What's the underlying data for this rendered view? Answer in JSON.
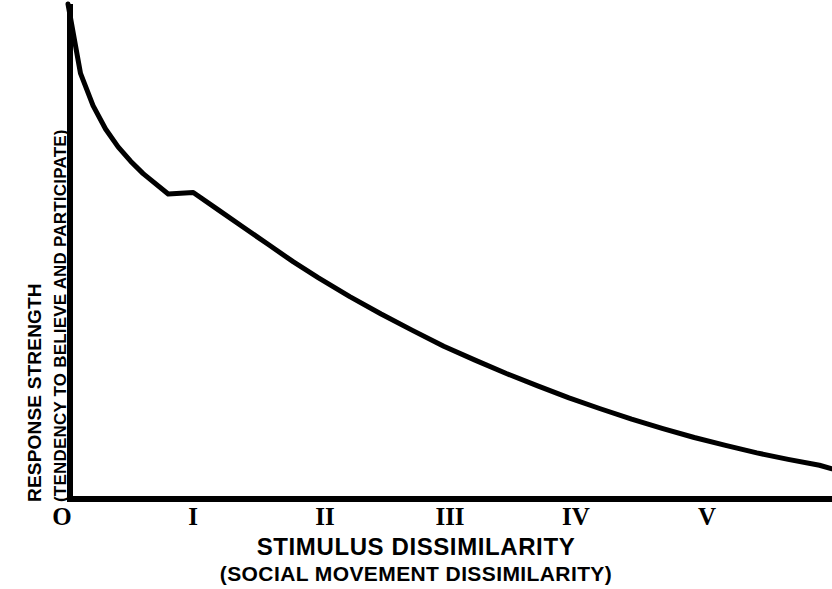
{
  "chart_data": {
    "type": "line",
    "title": "",
    "xlabel": "STIMULUS DISSIMILARITY",
    "xlabel_sub": "(SOCIAL MOVEMENT DISSIMILARITY)",
    "ylabel": "RESPONSE STRENGTH",
    "ylabel_sub": "(TENDENCY TO BELIEVE AND PARTICIPATE)",
    "grid": false,
    "legend": false,
    "xtick_labels": [
      "O",
      "I",
      "II",
      "III",
      "IV",
      "V"
    ],
    "ytick_labels": [],
    "xlim": [
      0,
      6.1
    ],
    "ylim": [
      0,
      1
    ],
    "axis_color": "#000000",
    "curve_color": "#000000",
    "background_color": "#ffffff",
    "series": [
      {
        "name": "response strength",
        "x": [
          0.0,
          0.1,
          0.2,
          0.3,
          0.4,
          0.5,
          0.6,
          0.8,
          1.0,
          1.2,
          1.4,
          1.6,
          1.8,
          2.0,
          2.25,
          2.5,
          2.75,
          3.0,
          3.25,
          3.5,
          3.75,
          4.0,
          4.25,
          4.5,
          4.75,
          5.0,
          5.25,
          5.5,
          5.75,
          6.0,
          6.1
        ],
        "y": [
          1.0,
          0.86,
          0.795,
          0.748,
          0.712,
          0.683,
          0.658,
          0.617,
          0.62,
          0.585,
          0.55,
          0.515,
          0.48,
          0.448,
          0.41,
          0.375,
          0.342,
          0.31,
          0.282,
          0.255,
          0.23,
          0.206,
          0.184,
          0.163,
          0.144,
          0.126,
          0.11,
          0.095,
          0.082,
          0.07,
          0.063
        ]
      }
    ]
  },
  "axes": {
    "x_tick_positions_px": [
      62,
      193,
      325,
      450,
      576,
      707
    ],
    "origin_px": [
      68,
      500
    ],
    "y_top_px": 4,
    "x_right_px": 832
  }
}
